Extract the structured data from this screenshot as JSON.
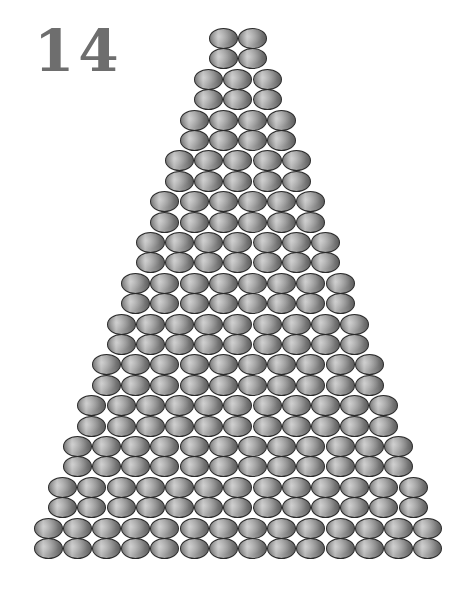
{
  "figure": {
    "label": "14",
    "row_counts": [
      2,
      2,
      3,
      3,
      4,
      4,
      5,
      5,
      6,
      6,
      7,
      7,
      8,
      8,
      9,
      9,
      10,
      10,
      11,
      11,
      12,
      12,
      13,
      13,
      14,
      14
    ],
    "total_rows": 26,
    "total_coins": 208,
    "coin_color": "#8f8f8f",
    "label_color": "#6e6e6e"
  }
}
